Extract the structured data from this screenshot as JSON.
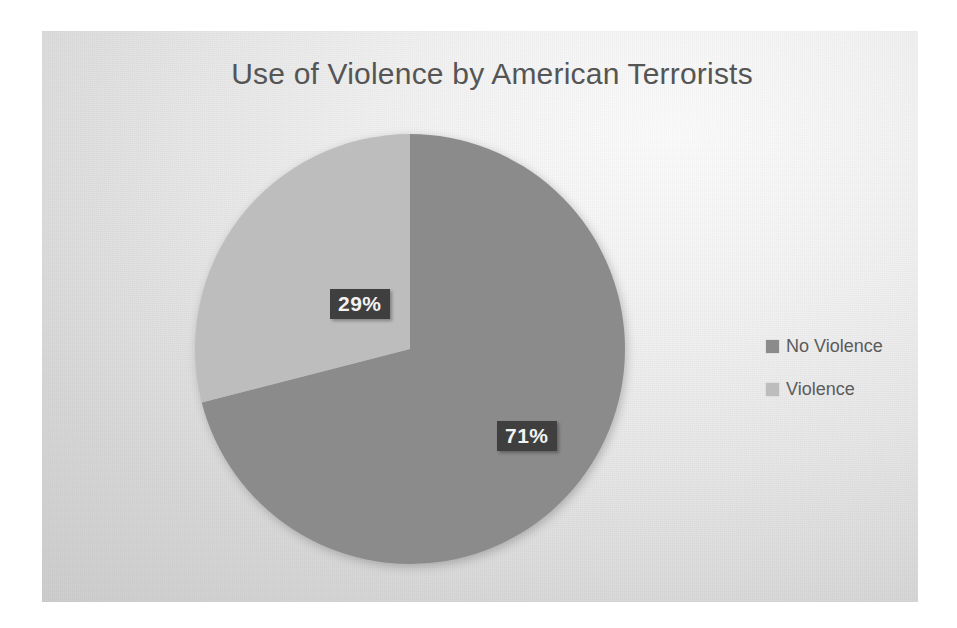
{
  "chart_data": {
    "type": "pie",
    "title": "Use of Violence by American Terrorists",
    "categories": [
      "No Violence",
      "Violence"
    ],
    "values": [
      71,
      29
    ],
    "value_labels": [
      "71%",
      "29%"
    ],
    "unit": "percent",
    "start_angle_deg": 0,
    "direction": "clockwise",
    "legend_position": "right",
    "grid": false,
    "xlabel": "",
    "ylabel": "",
    "slices": [
      {
        "name": "No Violence",
        "value": 71,
        "label": "71%",
        "color": "#8b8b8b",
        "start_deg": 0,
        "end_deg": 255.6
      },
      {
        "name": "Violence",
        "value": 29,
        "label": "29%",
        "color": "#bdbdbd",
        "start_deg": 255.6,
        "end_deg": 360
      }
    ]
  },
  "chart": {
    "title": "Use of Violence by American Terrorists",
    "labels": {
      "violence": "29%",
      "no_violence": "71%"
    }
  },
  "legend": {
    "items": [
      {
        "label": "No Violence",
        "color": "#8b8b8b"
      },
      {
        "label": "Violence",
        "color": "#bdbdbd"
      }
    ]
  },
  "colors": {
    "no_violence_slice": "#8b8b8b",
    "violence_slice": "#bdbdbd",
    "title_text": "#555555",
    "legend_text": "#5b5b5b",
    "data_label_background": "#3f3f3f",
    "data_label_text": "#f2f2f2",
    "panel_background": "#e6e6e6"
  }
}
